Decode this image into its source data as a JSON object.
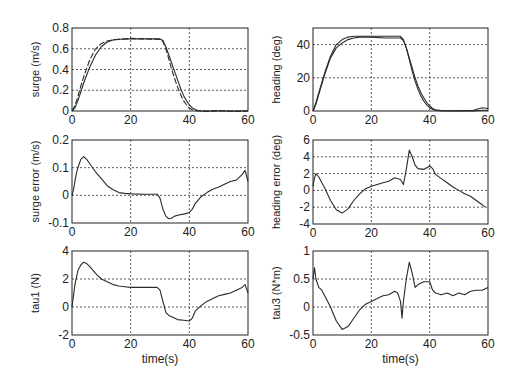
{
  "figure": {
    "background": "#ffffff",
    "line_color": "#2a2a2a",
    "grid_color": "#333333"
  },
  "chart_data": [
    {
      "id": "surge",
      "type": "line",
      "title": "",
      "xlabel": "",
      "ylabel": "surge (m/s)",
      "xlim": [
        0,
        60
      ],
      "ylim": [
        0,
        0.8
      ],
      "xticks": [
        "0",
        "20",
        "40",
        "60"
      ],
      "yticks": [
        "0",
        "0.2",
        "0.4",
        "0.6",
        "0.8"
      ],
      "grid": true,
      "box": {
        "x": 72,
        "y": 28,
        "w": 176,
        "h": 83
      },
      "series": [
        {
          "name": "desired",
          "style": "solid",
          "x": [
            0,
            1,
            2,
            4,
            6,
            8,
            10,
            12,
            14,
            16,
            20,
            25,
            30,
            31,
            32,
            33,
            34,
            35,
            36,
            37,
            38,
            39,
            40,
            41,
            42,
            43,
            44,
            46,
            50,
            55,
            60
          ],
          "y": [
            0,
            0.03,
            0.1,
            0.27,
            0.42,
            0.54,
            0.62,
            0.665,
            0.685,
            0.692,
            0.695,
            0.695,
            0.695,
            0.68,
            0.62,
            0.54,
            0.46,
            0.38,
            0.3,
            0.22,
            0.15,
            0.1,
            0.06,
            0.03,
            0.015,
            0.005,
            0,
            0,
            0,
            0,
            0
          ]
        },
        {
          "name": "actual",
          "style": "dashed",
          "x": [
            0,
            1,
            2,
            3,
            4,
            6,
            8,
            10,
            12,
            14,
            16,
            20,
            25,
            30,
            31,
            32,
            33,
            34,
            35,
            36,
            37,
            38,
            39,
            40,
            41,
            42,
            43,
            44,
            46,
            50,
            55,
            60
          ],
          "y": [
            0,
            0.05,
            0.14,
            0.24,
            0.33,
            0.49,
            0.6,
            0.65,
            0.675,
            0.685,
            0.69,
            0.7,
            0.695,
            0.69,
            0.67,
            0.6,
            0.5,
            0.4,
            0.31,
            0.23,
            0.16,
            0.1,
            0.06,
            0.03,
            0.012,
            0.005,
            0,
            0,
            -0.005,
            0.005,
            -0.005,
            0
          ]
        }
      ]
    },
    {
      "id": "heading",
      "type": "line",
      "title": "",
      "xlabel": "",
      "ylabel": "heading (deg)",
      "xlim": [
        0,
        60
      ],
      "ylim": [
        0,
        50
      ],
      "xticks": [
        "0",
        "20",
        "40",
        "60"
      ],
      "yticks": [
        "0",
        "20",
        "40"
      ],
      "ytick_values": [
        0,
        20,
        40
      ],
      "grid": true,
      "box": {
        "x": 313,
        "y": 28,
        "w": 175,
        "h": 83
      },
      "series": [
        {
          "name": "desired",
          "style": "solid",
          "x": [
            0,
            1,
            2,
            4,
            6,
            8,
            10,
            12,
            14,
            16,
            20,
            25,
            30,
            31,
            32,
            33,
            34,
            35,
            36,
            37,
            38,
            39,
            40,
            41,
            42,
            44,
            50,
            55,
            58,
            60
          ],
          "y": [
            0,
            5,
            11,
            23,
            33,
            40,
            43,
            44.5,
            45,
            45,
            45,
            45,
            45,
            43,
            38,
            31,
            24,
            18,
            13,
            9,
            6,
            3.5,
            2,
            1,
            0.5,
            0,
            0,
            0,
            0.5,
            0.5
          ]
        },
        {
          "name": "actual",
          "style": "solid",
          "x": [
            0,
            1,
            2,
            4,
            6,
            8,
            10,
            12,
            14,
            16,
            20,
            25,
            30,
            31,
            32,
            33,
            34,
            35,
            36,
            37,
            38,
            39,
            40,
            41,
            42,
            44,
            50,
            55,
            58,
            60
          ],
          "y": [
            0,
            4,
            10,
            22,
            32,
            38,
            41,
            43,
            44,
            44.5,
            44.5,
            44,
            44,
            42.5,
            38,
            32,
            26,
            20,
            15,
            11,
            8,
            5,
            3,
            1.5,
            0.8,
            0.3,
            0.2,
            0.5,
            2,
            1.5
          ]
        }
      ]
    },
    {
      "id": "surge_error",
      "type": "line",
      "title": "",
      "xlabel": "",
      "ylabel": "surge error (m/s)",
      "xlim": [
        0,
        60
      ],
      "ylim": [
        -0.1,
        0.2
      ],
      "xticks": [
        "0",
        "20",
        "40",
        "60"
      ],
      "yticks": [
        "-0.1",
        "0",
        "0.1",
        "0.2"
      ],
      "grid": true,
      "box": {
        "x": 72,
        "y": 140,
        "w": 176,
        "h": 83
      },
      "series": [
        {
          "name": "error",
          "style": "solid",
          "x": [
            0,
            0.5,
            1,
            1.5,
            2,
            3,
            4,
            5,
            6,
            8,
            10,
            12,
            14,
            16,
            18,
            20,
            25,
            29,
            30,
            31,
            32,
            33,
            34,
            35,
            36,
            38,
            40,
            41,
            42,
            44,
            46,
            48,
            50,
            52,
            54,
            56,
            58,
            59,
            60
          ],
          "y": [
            0,
            0.02,
            0.05,
            0.08,
            0.1,
            0.13,
            0.14,
            0.13,
            0.115,
            0.085,
            0.06,
            0.035,
            0.02,
            0.01,
            0.007,
            0.005,
            0.004,
            0.004,
            -0.01,
            -0.05,
            -0.075,
            -0.085,
            -0.082,
            -0.075,
            -0.072,
            -0.068,
            -0.062,
            -0.05,
            -0.03,
            -0.005,
            0.01,
            0.022,
            0.03,
            0.04,
            0.05,
            0.055,
            0.075,
            0.09,
            0.05
          ]
        }
      ]
    },
    {
      "id": "heading_error",
      "type": "line",
      "title": "",
      "xlabel": "",
      "ylabel": "heading error (deg)",
      "xlim": [
        0,
        60
      ],
      "ylim": [
        -4,
        6
      ],
      "xticks": [
        "0",
        "20",
        "40",
        "60"
      ],
      "yticks": [
        "-4",
        "-2",
        "0",
        "2",
        "4",
        "6"
      ],
      "grid": true,
      "box": {
        "x": 313,
        "y": 140,
        "w": 175,
        "h": 84
      },
      "series": [
        {
          "name": "error",
          "style": "solid",
          "x": [
            0,
            0.5,
            1,
            2,
            4,
            6,
            8,
            10,
            12,
            14,
            16,
            18,
            20,
            22,
            24,
            26,
            28,
            30,
            31,
            32,
            33,
            34,
            35,
            36,
            38,
            40,
            41,
            42,
            44,
            46,
            48,
            50,
            52,
            54,
            56,
            58,
            59
          ],
          "y": [
            0.5,
            1.5,
            2,
            1.6,
            0.3,
            -1.2,
            -2.3,
            -2.7,
            -2.2,
            -1.2,
            -0.4,
            0.2,
            0.5,
            0.7,
            0.9,
            1.1,
            1.5,
            1.3,
            0.7,
            2.5,
            4.8,
            4.0,
            3.0,
            2.6,
            2.5,
            2.9,
            2.6,
            1.9,
            1.4,
            0.9,
            0.4,
            0,
            -0.4,
            -0.7,
            -1.2,
            -1.7,
            -2
          ]
        }
      ]
    },
    {
      "id": "tau1",
      "type": "line",
      "title": "",
      "xlabel": "time(s)",
      "ylabel": "tau1 (N)",
      "xlim": [
        0,
        60
      ],
      "ylim": [
        -2,
        4
      ],
      "xticks": [
        "0",
        "20",
        "40",
        "60"
      ],
      "yticks": [
        "-2",
        "0",
        "2",
        "4"
      ],
      "grid": true,
      "box": {
        "x": 72,
        "y": 251,
        "w": 176,
        "h": 84
      },
      "series": [
        {
          "name": "tau1",
          "style": "solid",
          "x": [
            0,
            0.5,
            1,
            2,
            3,
            4,
            5,
            6,
            8,
            10,
            12,
            14,
            16,
            18,
            20,
            25,
            29,
            30,
            31,
            32,
            33,
            34,
            36,
            38,
            40,
            41,
            42,
            44,
            46,
            48,
            50,
            52,
            54,
            56,
            58,
            59,
            60
          ],
          "y": [
            0,
            0.8,
            1.6,
            2.6,
            3.0,
            3.2,
            3.1,
            2.9,
            2.4,
            2.0,
            1.8,
            1.6,
            1.5,
            1.45,
            1.4,
            1.4,
            1.4,
            1.2,
            0.4,
            -0.4,
            -0.6,
            -0.7,
            -0.9,
            -0.95,
            -1.0,
            -0.8,
            -0.3,
            0.1,
            0.4,
            0.6,
            0.8,
            0.9,
            1.0,
            1.2,
            1.4,
            1.6,
            1.0
          ]
        }
      ]
    },
    {
      "id": "tau3",
      "type": "line",
      "title": "",
      "xlabel": "time(s)",
      "ylabel": "tau3 (N*m)",
      "xlim": [
        0,
        60
      ],
      "ylim": [
        -0.5,
        1
      ],
      "xticks": [
        "0",
        "20",
        "40",
        "60"
      ],
      "yticks": [
        "-0.5",
        "0",
        "0.5",
        "1"
      ],
      "grid": true,
      "box": {
        "x": 313,
        "y": 251,
        "w": 175,
        "h": 84
      },
      "series": [
        {
          "name": "tau3",
          "style": "solid",
          "x": [
            0,
            0.5,
            1,
            2,
            3,
            4,
            6,
            8,
            10,
            12,
            14,
            16,
            18,
            20,
            22,
            24,
            26,
            28,
            29,
            30,
            30.5,
            31,
            32,
            33,
            34,
            35,
            36,
            38,
            40,
            41,
            42,
            44,
            46,
            48,
            50,
            52,
            54,
            56,
            58,
            60
          ],
          "y": [
            0.5,
            0.7,
            0.5,
            0.35,
            0.3,
            0.2,
            0.0,
            -0.25,
            -0.4,
            -0.35,
            -0.2,
            -0.05,
            0.05,
            0.1,
            0.15,
            0.2,
            0.22,
            0.28,
            0.25,
            0.1,
            -0.2,
            0.1,
            0.5,
            0.8,
            0.6,
            0.35,
            0.4,
            0.45,
            0.45,
            0.3,
            0.25,
            0.22,
            0.25,
            0.2,
            0.25,
            0.22,
            0.28,
            0.3,
            0.3,
            0.35
          ]
        }
      ]
    }
  ]
}
